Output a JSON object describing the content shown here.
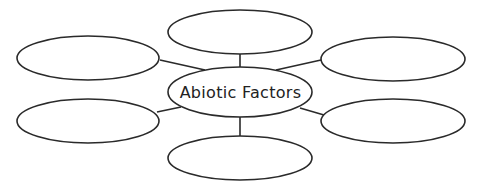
{
  "diagram": {
    "type": "concept-web",
    "center": {
      "label": "Abiotic Factors"
    },
    "nodes": [
      {
        "id": "top",
        "label": ""
      },
      {
        "id": "left-upper",
        "label": ""
      },
      {
        "id": "right-upper",
        "label": ""
      },
      {
        "id": "left-lower",
        "label": ""
      },
      {
        "id": "right-lower",
        "label": ""
      },
      {
        "id": "bottom",
        "label": ""
      }
    ],
    "colors": {
      "stroke": "#2a2a2a",
      "background": "#ffffff",
      "text": "#222222"
    }
  }
}
